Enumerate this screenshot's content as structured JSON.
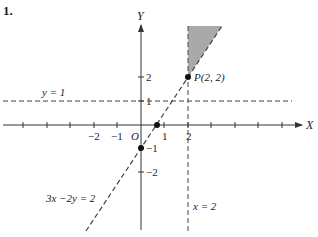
{
  "problem_number": "1.",
  "axes": {
    "x_label": "X",
    "y_label": "Y",
    "origin_label": "O",
    "x_tick_labels": [
      "−2",
      "−1",
      "1",
      "2"
    ],
    "y_tick_labels": [
      "2",
      "1",
      "−1",
      "−2"
    ]
  },
  "lines": {
    "horizontal": {
      "label": "y = 1",
      "style": "dashed"
    },
    "vertical": {
      "label": "x = 2",
      "style": "dashed"
    },
    "oblique": {
      "label": "3x −2y = 2",
      "style": "dashed"
    }
  },
  "points": {
    "P": {
      "label": "P(2, 2)",
      "x": 2,
      "y": 2
    },
    "y_intercept": {
      "x": 0,
      "y": -1
    },
    "x_intercept": {
      "x": 0.667,
      "y": 0
    }
  },
  "region": {
    "description": "shaded region bounded by x = 2 and 3x − 2y = 2 above P(2,2)",
    "fill": "#a9a9a9"
  },
  "colors": {
    "axis": "#333333",
    "dashed": "#444444",
    "text": "#222222"
  }
}
